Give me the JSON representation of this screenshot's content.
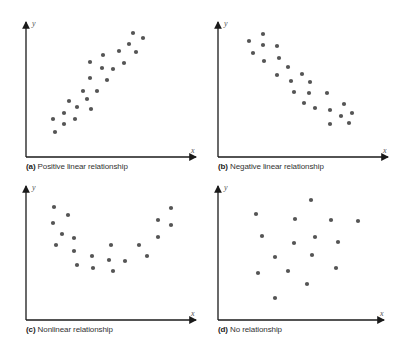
{
  "chart_data": [
    {
      "type": "scatter",
      "panel": "a",
      "title": "Positive linear relationship",
      "caption_letter": "(a)",
      "xlabel": "x",
      "ylabel": "y",
      "grid": false,
      "points": [
        [
          133,
          33
        ],
        [
          143,
          38
        ],
        [
          129,
          44
        ],
        [
          136,
          52
        ],
        [
          119,
          51
        ],
        [
          103,
          55
        ],
        [
          90,
          62
        ],
        [
          124,
          63
        ],
        [
          102,
          68
        ],
        [
          113,
          69
        ],
        [
          90,
          78
        ],
        [
          107,
          80
        ],
        [
          83,
          91
        ],
        [
          97,
          91
        ],
        [
          69,
          101
        ],
        [
          87,
          99
        ],
        [
          77,
          107
        ],
        [
          91,
          109
        ],
        [
          53,
          119
        ],
        [
          64,
          113
        ],
        [
          75,
          119
        ],
        [
          64,
          124
        ],
        [
          55,
          132
        ]
      ]
    },
    {
      "type": "scatter",
      "panel": "b",
      "title": "Negative linear relationship",
      "caption_letter": "(b)",
      "xlabel": "x",
      "ylabel": "y",
      "grid": false,
      "points": [
        [
          249,
          41
        ],
        [
          263,
          34
        ],
        [
          263,
          45
        ],
        [
          277,
          46
        ],
        [
          253,
          53
        ],
        [
          264,
          61
        ],
        [
          279,
          58
        ],
        [
          288,
          67
        ],
        [
          277,
          75
        ],
        [
          302,
          74
        ],
        [
          291,
          81
        ],
        [
          310,
          82
        ],
        [
          294,
          92
        ],
        [
          309,
          93
        ],
        [
          327,
          93
        ],
        [
          304,
          103
        ],
        [
          315,
          108
        ],
        [
          330,
          110
        ],
        [
          344,
          104
        ],
        [
          341,
          116
        ],
        [
          352,
          113
        ],
        [
          330,
          124
        ],
        [
          349,
          123
        ]
      ]
    },
    {
      "type": "scatter",
      "panel": "c",
      "title": "Nonlinear relationship",
      "caption_letter": "(c)",
      "xlabel": "x",
      "ylabel": "y",
      "grid": false,
      "points": [
        [
          54,
          207
        ],
        [
          68,
          215
        ],
        [
          53,
          223
        ],
        [
          62,
          234
        ],
        [
          74,
          238
        ],
        [
          56,
          245
        ],
        [
          74,
          251
        ],
        [
          77,
          265
        ],
        [
          92,
          256
        ],
        [
          93,
          268
        ],
        [
          111,
          245
        ],
        [
          109,
          260
        ],
        [
          113,
          271
        ],
        [
          125,
          261
        ],
        [
          139,
          245
        ],
        [
          147,
          256
        ],
        [
          158,
          220
        ],
        [
          158,
          237
        ],
        [
          171,
          208
        ],
        [
          171,
          225
        ]
      ]
    },
    {
      "type": "scatter",
      "panel": "d",
      "title": "No relationship",
      "caption_letter": "(d)",
      "xlabel": "x",
      "ylabel": "y",
      "grid": false,
      "points": [
        [
          311,
          200
        ],
        [
          256,
          214
        ],
        [
          295,
          219
        ],
        [
          331,
          220
        ],
        [
          358,
          221
        ],
        [
          262,
          236
        ],
        [
          315,
          237
        ],
        [
          294,
          243
        ],
        [
          338,
          242
        ],
        [
          275,
          257
        ],
        [
          312,
          255
        ],
        [
          258,
          273
        ],
        [
          288,
          271
        ],
        [
          336,
          268
        ],
        [
          307,
          284
        ],
        [
          275,
          298
        ]
      ]
    }
  ],
  "panels": [
    {
      "letter": "(a)",
      "label": "Positive linear relationship",
      "x_axis": "x",
      "y_axis": "y"
    },
    {
      "letter": "(b)",
      "label": "Negative linear relationship",
      "x_axis": "x",
      "y_axis": "y"
    },
    {
      "letter": "(c)",
      "label": "Nonlinear relationship",
      "x_axis": "x",
      "y_axis": "y"
    },
    {
      "letter": "(d)",
      "label": "No relationship",
      "x_axis": "x",
      "y_axis": "y"
    }
  ],
  "colors": {
    "dot": "#555555",
    "axis": "#1a1a1a"
  }
}
